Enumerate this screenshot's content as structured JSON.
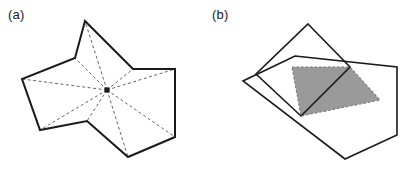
{
  "figure": {
    "width": 409,
    "height": 171,
    "background": "#ffffff",
    "stroke_color": "#1a1a1a",
    "dashed_color": "#555555",
    "shade_fill": "#9a9a9a",
    "shade_stroke": "#777777",
    "kernel_dot_color": "#1a1a1a"
  },
  "panels": [
    {
      "id": "a",
      "label": "(a)",
      "caption_position": "top-left",
      "description": "star-shaped polygon with kernel point and dashed visibility rays",
      "polygon": {
        "name": "star-shaped-polygon",
        "points": "85,21 133,69 175,69 175,137 128,157 87,121 40,130 22,79 75,58",
        "stroke_width": 2
      },
      "kernel_point": {
        "x": 107,
        "y": 90,
        "radius": 2.6
      },
      "rays": [
        {
          "to_x": 85,
          "to_y": 21
        },
        {
          "to_x": 133,
          "to_y": 69
        },
        {
          "to_x": 175,
          "to_y": 69
        },
        {
          "to_x": 175,
          "to_y": 137
        },
        {
          "to_x": 128,
          "to_y": 157
        },
        {
          "to_x": 87,
          "to_y": 121
        },
        {
          "to_x": 40,
          "to_y": 130
        },
        {
          "to_x": 22,
          "to_y": 79
        },
        {
          "to_x": 75,
          "to_y": 58
        }
      ],
      "ray_dash": "3,2.5",
      "ray_width": 0.9
    },
    {
      "id": "b",
      "label": "(b)",
      "caption_position": "top-left",
      "description": "two overlapping convex quadrilaterals with shaded intersection",
      "quad_left": {
        "name": "tilted-quadrilateral",
        "points": "308,24 350,67 301,116 256,74",
        "stroke_width": 1.6
      },
      "quad_right": {
        "name": "axis-aligned-quadrilateral",
        "points": "295,56 397,67 397,135 345,159 243,81",
        "stroke_width": 1.6
      },
      "intersection": {
        "name": "intersection-region",
        "points": "292,67 350,67 380,100 301,116",
        "fill": "#9a9a9a",
        "stroke_dash": "2.5,2",
        "stroke_width": 1.1
      }
    }
  ]
}
